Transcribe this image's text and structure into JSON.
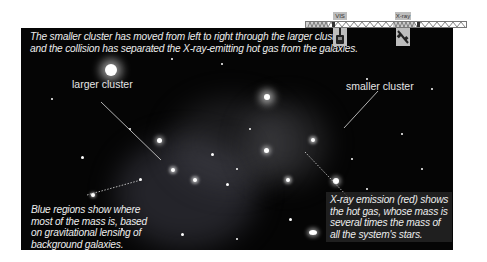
{
  "header_caption": {
    "line1": "The smaller cluster has moved from left to right through the larger cluster,",
    "line2": "and the collision has separated the X-ray-emitting hot gas from the galaxies."
  },
  "instruments": [
    {
      "label": "VIS",
      "icon": "telescope-icon"
    },
    {
      "label": "X-ray",
      "icon": "satellite-icon"
    }
  ],
  "labels": {
    "larger_cluster": "larger cluster",
    "smaller_cluster": "smaller cluster"
  },
  "annotations": {
    "blue_regions": {
      "line1": "Blue regions show where",
      "line2": "most of the mass is, based",
      "line3": "on gravitational lensing of",
      "line4": "background galaxies."
    },
    "xray_emission": {
      "line1": "X-ray emission (red) shows",
      "line2": "the hot gas, whose mass is",
      "line3": "several times the mass of",
      "line4": "all the system's stars."
    }
  },
  "colors": {
    "panel_bg": "#050505",
    "text": "#ececec",
    "instrument_bar": "#bdbdbd"
  }
}
